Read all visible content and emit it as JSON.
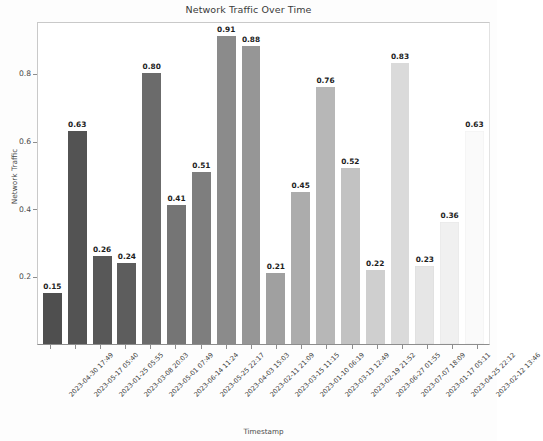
{
  "chart_data": {
    "type": "bar",
    "title": "Network Traffic Over Time",
    "xlabel": "Timestamp",
    "ylabel": "Network Traffic",
    "ylim": [
      0,
      0.955
    ],
    "ytick_labels": [
      "0.2",
      "0.4",
      "0.6",
      "0.8"
    ],
    "ytick_values": [
      0.2,
      0.4,
      0.6,
      0.8
    ],
    "grid": false,
    "legend": null,
    "bar_label_format": "2 decimals",
    "categories": [
      "2023-04-30 17:49",
      "2023-05-17 05:40",
      "2023-01-25 05:55",
      "2023-03-08 20:03",
      "2023-05-01 07:49",
      "2023-06-14 11:24",
      "2023-05-25 22:17",
      "2023-04-03 15:03",
      "2023-02-11 21:09",
      "2023-03-15 11:15",
      "2023-01-10 06:19",
      "2023-03-13 12:49",
      "2023-02-19 21:52",
      "2023-06-27 01:55",
      "2023-07-07 18:09",
      "2023-01-17 05:11",
      "2023-04-25 22:12",
      "2023-02-12 13:46"
    ],
    "values": [
      0.15,
      0.63,
      0.26,
      0.24,
      0.8,
      0.41,
      0.51,
      0.91,
      0.88,
      0.21,
      0.45,
      0.76,
      0.52,
      0.22,
      0.83,
      0.23,
      0.36,
      0.63
    ],
    "value_labels": [
      "0.15",
      "0.63",
      "0.26",
      "0.24",
      "0.80",
      "0.41",
      "0.51",
      "0.91",
      "0.88",
      "0.21",
      "0.45",
      "0.76",
      "0.52",
      "0.22",
      "0.83",
      "0.23",
      "0.36",
      "0.63"
    ],
    "bar_colors": [
      "#4f4f4f",
      "#535353",
      "#585858",
      "#5d5d5d",
      "#6b6b6b",
      "#757575",
      "#7e7e7e",
      "#8b8b8b",
      "#969696",
      "#a0a0a0",
      "#acacac",
      "#b7b7b7",
      "#c2c2c2",
      "#cfcfcf",
      "#dadada",
      "#e6e6e6",
      "#f0f0f0",
      "#fafafa"
    ],
    "axis_color": "#8d8d8d",
    "text_color": "#3a3a3a"
  }
}
